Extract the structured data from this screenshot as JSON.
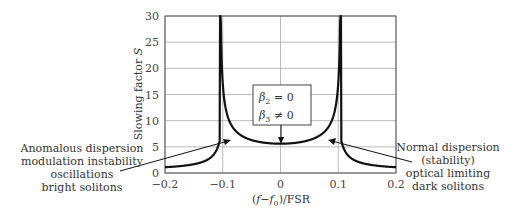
{
  "chart_data": {
    "type": "line",
    "title": "",
    "xlabel": "(f−f0)/FSR",
    "ylabel": "Slowing factor S",
    "xlim": [
      -0.2,
      0.2
    ],
    "ylim": [
      0,
      30
    ],
    "x_ticks": [
      "−0.2",
      "−0.1",
      "0",
      "0.1",
      "0.2"
    ],
    "y_ticks": [
      "0",
      "5",
      "10",
      "15",
      "20",
      "25",
      "30"
    ],
    "grid": true,
    "legend": null,
    "series": [
      {
        "name": "Slowing factor S",
        "x": [
          -0.2,
          -0.18,
          -0.16,
          -0.14,
          -0.13,
          -0.12,
          -0.115,
          -0.11,
          -0.105,
          -0.1,
          -0.095,
          -0.09,
          -0.08,
          -0.06,
          -0.04,
          -0.02,
          0,
          0.02,
          0.04,
          0.06,
          0.08,
          0.09,
          0.095,
          0.1,
          0.105,
          0.11,
          0.115,
          0.12,
          0.13,
          0.14,
          0.16,
          0.18,
          0.2
        ],
        "y": [
          0.5,
          0.7,
          1.0,
          1.8,
          2.7,
          5.0,
          8.5,
          30,
          30,
          30,
          15,
          11,
          8.5,
          6.8,
          6.0,
          5.7,
          5.6,
          5.7,
          6.0,
          6.8,
          8.5,
          11,
          15,
          30,
          30,
          30,
          8.5,
          5.0,
          2.7,
          1.8,
          1.0,
          0.7,
          0.5
        ]
      }
    ],
    "annotations": {
      "box": {
        "line1": "β2 = 0",
        "line2": "β3 ≠ 0",
        "points_to": [
          0,
          5.6
        ]
      },
      "left": {
        "lines": [
          "Anomalous dispersion",
          "modulation instability",
          "oscillations",
          "bright solitons"
        ],
        "points_to": [
          -0.09,
          6.5
        ]
      },
      "right": {
        "lines": [
          "Normal dispersion",
          "(stability)",
          "optical limiting",
          "dark solitons"
        ],
        "points_to": [
          0.09,
          6.5
        ]
      }
    }
  },
  "axes": {
    "ylabel_main": "Slowing factor ",
    "ylabel_var": "S",
    "xlabel_open": "(",
    "xlabel_f": "f",
    "xlabel_minus": "−",
    "xlabel_f0": "f",
    "xlabel_sub": "0",
    "xlabel_close": ")/FSR"
  },
  "box": {
    "beta": "β",
    "sub2": "2",
    "eq": " = 0",
    "sub3": "3",
    "neq": " ≠ 0"
  },
  "colors": {
    "curve": "#111111",
    "grid": "#a8a8a8",
    "axis": "#555555",
    "text": "#333333"
  }
}
